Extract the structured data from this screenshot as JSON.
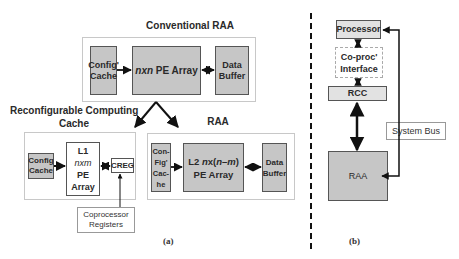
{
  "panel_a": {
    "caption": "(a)",
    "conventional": {
      "title": "Conventional RAA",
      "config_cache": [
        "Config'",
        "Cache"
      ],
      "pe_array_italic": "nxn",
      "pe_array_label": " PE Array",
      "data_buffer": [
        "Data",
        "Buffer"
      ]
    },
    "rcc": {
      "title_line1": "Reconfigurable Computing",
      "title_line2": "Cache",
      "config_cache": [
        "Config",
        "Cache"
      ],
      "l1": {
        "line1": "L1",
        "line2_italic": "nxm",
        "line3": "PE",
        "line4": "Array"
      },
      "creg": "CREG",
      "coprocessor_registers": [
        "Coprocessor",
        "Registers"
      ]
    },
    "raa": {
      "title": "RAA",
      "config_cache": [
        "Con-",
        "Fig'",
        "Cac-",
        "he"
      ],
      "l2": {
        "prefix": "L2 ",
        "italic_n": "n",
        "x": "x(",
        "italic_nm": "n–m",
        "close": ")",
        "line2": "PE Array"
      },
      "data_buffer": [
        "Data",
        "Buffer"
      ]
    }
  },
  "panel_b": {
    "caption": "(b)",
    "processor": "Processor",
    "coproc_interface": [
      "Co-proc'",
      "Interface"
    ],
    "rcc": "RCC",
    "system_bus": "System Bus",
    "raa": "RAA"
  },
  "colors": {
    "block_gray": "#c6c6c6",
    "block_light": "#e2e2e2",
    "frame": "#c8c8c8",
    "line": "#111111"
  }
}
